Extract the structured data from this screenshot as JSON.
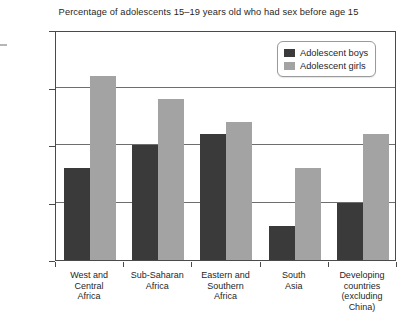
{
  "chart_data": {
    "type": "bar",
    "title": "Percentage of adolescents 15–19 years old who had sex before age 15",
    "xlabel": "",
    "ylabel": "",
    "ylim": [
      0,
      20
    ],
    "ytick_labels": [
      "0%",
      "5%",
      "10%",
      "15%",
      "20%"
    ],
    "ytick_values": [
      0,
      5,
      10,
      15,
      20
    ],
    "grid": true,
    "legend_position": "top-right",
    "categories": [
      "West and Central Africa",
      "Sub-Saharan Africa",
      "Eastern and Southern Africa",
      "South Asia",
      "Developing countries (excluding China)"
    ],
    "category_lines": [
      [
        "West and",
        "Central",
        "Africa"
      ],
      [
        "Sub-Saharan",
        "Africa"
      ],
      [
        "Eastern and",
        "Southern",
        "Africa"
      ],
      [
        "South",
        "Asia"
      ],
      [
        "Developing",
        "countries",
        "(excluding",
        "China)"
      ]
    ],
    "series": [
      {
        "name": "Adolescent boys",
        "color": "#3a3a3a",
        "values": [
          8,
          10,
          11,
          3,
          5
        ]
      },
      {
        "name": "Adolescent girls",
        "color": "#a3a3a3",
        "values": [
          16,
          14,
          12,
          8,
          11
        ]
      }
    ]
  },
  "legend": {
    "items": [
      {
        "label": "Adolescent boys",
        "color": "#3a3a3a"
      },
      {
        "label": "Adolescent girls",
        "color": "#a3a3a3"
      }
    ]
  }
}
